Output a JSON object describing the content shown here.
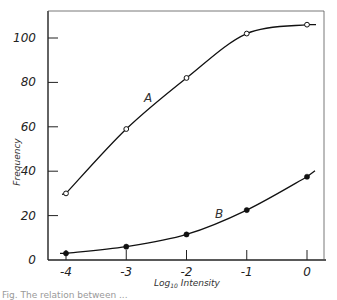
{
  "chart_data": {
    "type": "line",
    "title": "",
    "xlabel": "Log10 Intensity",
    "ylabel": "Frequency",
    "x": [
      -4,
      -3,
      -2,
      -1,
      0
    ],
    "xlim": [
      -4.3,
      0.3
    ],
    "ylim": [
      0,
      112
    ],
    "xticks": [
      "-4",
      "-3",
      "-2",
      "-1",
      "0"
    ],
    "yticks": [
      "0",
      "20",
      "40",
      "60",
      "80",
      "100"
    ],
    "grid": false,
    "legend": "inline labels",
    "series": [
      {
        "name": "A",
        "marker": "open-circle",
        "values": [
          30,
          59,
          82,
          102,
          106
        ]
      },
      {
        "name": "B",
        "marker": "filled-circle",
        "values": [
          3,
          6,
          11.5,
          22.5,
          37.5
        ]
      }
    ]
  },
  "labels": {
    "ylabel": "Frequency",
    "xlabel_main": "Log",
    "xlabel_sub": "10",
    "xlabel_rest": " Intensity",
    "series_a": "A",
    "series_b": "B",
    "ticks_x": [
      "-4",
      "-3",
      "-2",
      "-1",
      "0"
    ],
    "ticks_y": [
      "0",
      "20",
      "40",
      "60",
      "80",
      "100"
    ],
    "caption": "Fig. The relation between ..."
  }
}
